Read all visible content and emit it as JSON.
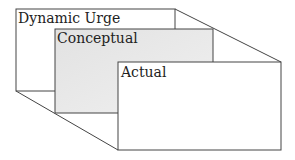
{
  "diagram": {
    "type": "nested-perspective-boxes",
    "layers": [
      {
        "label": "Dynamic Urge",
        "fill": "#ffffff"
      },
      {
        "label": "Conceptual",
        "fill": "#e6e6e6"
      },
      {
        "label": "Actual",
        "fill": "#ffffff"
      }
    ],
    "line_color": "#444444"
  }
}
